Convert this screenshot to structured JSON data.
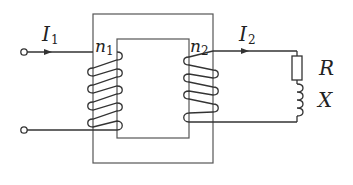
{
  "diagram": {
    "type": "transformer-circuit",
    "primary": {
      "current_label": "I",
      "current_sub": "1",
      "turns_label": "n",
      "turns_sub": "1"
    },
    "secondary": {
      "current_label": "I",
      "current_sub": "2",
      "turns_label": "n",
      "turns_sub": "2"
    },
    "load": {
      "resistor_label": "R",
      "reactance_label": "X"
    },
    "colors": {
      "line": "#333333",
      "core": "#555555",
      "background": "#ffffff"
    }
  }
}
